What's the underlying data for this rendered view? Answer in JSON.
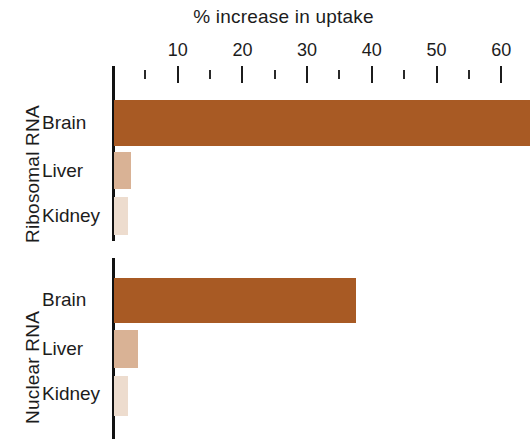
{
  "chart": {
    "title": "% increase in uptake"
  },
  "axis": {
    "tick_labels": [
      "10",
      "20",
      "30",
      "40",
      "50",
      "60"
    ],
    "tick_values": [
      10,
      20,
      30,
      40,
      50,
      60
    ],
    "minor_tick_values": [
      5,
      15,
      25,
      35,
      45,
      55
    ],
    "zero_tick_value": 0
  },
  "groups": [
    {
      "name": "Ribosomal RNA",
      "rows": [
        {
          "label": "Brain",
          "value": 64.5,
          "color": "#A85A24",
          "clipped": true
        },
        {
          "label": "Liver",
          "value": 2.8,
          "color": "#D9B295",
          "clipped": false
        },
        {
          "label": "Kidney",
          "value": 2.3,
          "color": "#EDDCCE",
          "clipped": false
        }
      ]
    },
    {
      "name": "Nuclear RNA",
      "rows": [
        {
          "label": "Brain",
          "value": 37.5,
          "color": "#A85A24",
          "clipped": false
        },
        {
          "label": "Liver",
          "value": 3.9,
          "color": "#D9B295",
          "clipped": false
        },
        {
          "label": "Kidney",
          "value": 2.3,
          "color": "#EDDCCE",
          "clipped": false
        }
      ]
    }
  ],
  "chart_data": {
    "type": "bar",
    "orientation": "horizontal",
    "title": "% increase in uptake",
    "xlabel": "% increase in uptake",
    "ylabel": "",
    "xlim": [
      0,
      64.5
    ],
    "xticks": [
      0,
      10,
      20,
      30,
      40,
      50,
      60
    ],
    "xtick_labels": [
      "",
      "10",
      "20",
      "30",
      "40",
      "50",
      "60"
    ],
    "minor_xticks": [
      5,
      15,
      25,
      35,
      45,
      55
    ],
    "grid": false,
    "legend": "none",
    "categories": [
      "Ribosomal RNA - Brain",
      "Ribosomal RNA - Liver",
      "Ribosomal RNA - Kidney",
      "Nuclear RNA - Brain",
      "Nuclear RNA - Liver",
      "Nuclear RNA - Kidney"
    ],
    "values": [
      64.5,
      2.8,
      2.3,
      37.5,
      3.9,
      2.3
    ],
    "bar_colors": [
      "#A85A24",
      "#D9B295",
      "#EDDCCE",
      "#A85A24",
      "#D9B295",
      "#EDDCCE"
    ]
  }
}
